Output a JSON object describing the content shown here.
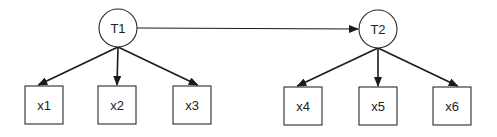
{
  "diagram": {
    "type": "path-diagram",
    "latent_nodes": [
      {
        "id": "T1",
        "label": "T1",
        "shape": "circle"
      },
      {
        "id": "T2",
        "label": "T2",
        "shape": "circle"
      }
    ],
    "observed_nodes": [
      {
        "id": "x1",
        "label": "x1",
        "shape": "box",
        "parent": "T1"
      },
      {
        "id": "x2",
        "label": "x2",
        "shape": "box",
        "parent": "T1"
      },
      {
        "id": "x3",
        "label": "x3",
        "shape": "box",
        "parent": "T1"
      },
      {
        "id": "x4",
        "label": "x4",
        "shape": "box",
        "parent": "T2"
      },
      {
        "id": "x5",
        "label": "x5",
        "shape": "box",
        "parent": "T2"
      },
      {
        "id": "x6",
        "label": "x6",
        "shape": "box",
        "parent": "T2"
      }
    ],
    "edges": [
      {
        "from": "T1",
        "to": "T2",
        "directed": true
      },
      {
        "from": "T1",
        "to": "x1",
        "directed": true
      },
      {
        "from": "T1",
        "to": "x2",
        "directed": true
      },
      {
        "from": "T1",
        "to": "x3",
        "directed": true
      },
      {
        "from": "T2",
        "to": "x4",
        "directed": true
      },
      {
        "from": "T2",
        "to": "x5",
        "directed": true
      },
      {
        "from": "T2",
        "to": "x6",
        "directed": true
      }
    ],
    "colors": {
      "stroke": "#1a1a1a",
      "fill": "#ffffff",
      "text": "#222222"
    }
  }
}
